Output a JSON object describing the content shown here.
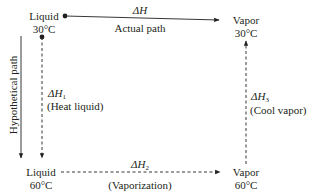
{
  "diagram": {
    "states": {
      "top_left": {
        "phase": "Liquid",
        "temp": "30°C"
      },
      "top_right": {
        "phase": "Vapor",
        "temp": "30°C"
      },
      "bottom_left": {
        "phase": "Liquid",
        "temp": "60°C"
      },
      "bottom_right": {
        "phase": "Vapor",
        "temp": "60°C"
      }
    },
    "actual": {
      "symbol": "ΔH",
      "label": "Actual path"
    },
    "hypothetical_label": "Hypothetical path",
    "step1": {
      "symbol": "ΔH",
      "sub": "1",
      "label": "(Heat liquid)"
    },
    "step2": {
      "symbol": "ΔH",
      "sub": "2",
      "label": "(Vaporization)"
    },
    "step3": {
      "symbol": "ΔH",
      "sub": "3",
      "label": "(Cool vapor)"
    },
    "colors": {
      "ink": "#231f20",
      "background": "#ffffff"
    }
  }
}
